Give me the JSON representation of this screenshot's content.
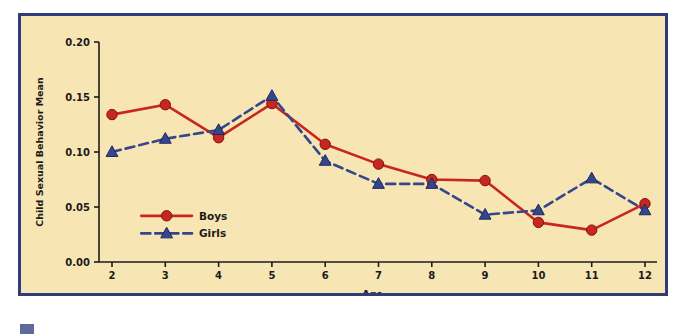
{
  "figure": {
    "frame_border_color": "#2e3d7a",
    "plot_background_color": "#f7e5b4",
    "page_background_color": "#ffffff",
    "corner_tag_color": "#5f6a9a"
  },
  "chart_data": {
    "type": "line",
    "title": "",
    "xlabel": "Age",
    "ylabel": "Child Sexual Behavior Mean",
    "categories": [
      2,
      3,
      4,
      5,
      6,
      7,
      8,
      9,
      10,
      11,
      12
    ],
    "x": [
      2,
      3,
      4,
      5,
      6,
      7,
      8,
      9,
      10,
      11,
      12
    ],
    "xlim": [
      1.6,
      12.5
    ],
    "ylim": [
      0.0,
      0.2
    ],
    "xticks": [
      "2",
      "3",
      "4",
      "5",
      "6",
      "7",
      "8",
      "9",
      "10",
      "11",
      "12"
    ],
    "yticks": [
      "0.00",
      "0.05",
      "0.10",
      "0.15",
      "0.20"
    ],
    "ytick_values": [
      0.0,
      0.05,
      0.1,
      0.15,
      0.2
    ],
    "grid": false,
    "legend_position": "inner-lower-left",
    "series": [
      {
        "name": "Boys",
        "color": "#c9261f",
        "marker": "circle",
        "linestyle": "solid",
        "values": [
          0.134,
          0.143,
          0.113,
          0.144,
          0.107,
          0.089,
          0.075,
          0.074,
          0.036,
          0.029,
          0.053
        ]
      },
      {
        "name": "Girls",
        "color": "#34468c",
        "marker": "triangle",
        "linestyle": "dashed",
        "values": [
          0.1,
          0.112,
          0.12,
          0.151,
          0.092,
          0.071,
          0.071,
          0.043,
          0.047,
          0.076,
          0.047
        ]
      }
    ]
  },
  "legend": {
    "items": [
      {
        "label": "Boys"
      },
      {
        "label": "Girls"
      }
    ]
  }
}
